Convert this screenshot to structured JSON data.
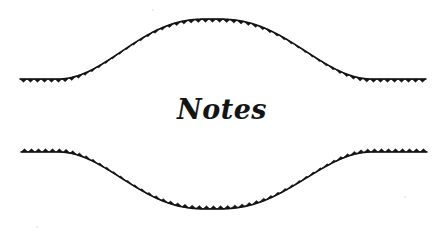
{
  "page": {
    "width": 444,
    "height": 234,
    "background_color": "#ffffff",
    "ink_color": "#141414"
  },
  "heading": {
    "text": "Notes",
    "style": "handwritten-brush-script",
    "center_x": 215,
    "baseline_y": 124
  },
  "ornament": {
    "name": "notes-section-divider",
    "description": "Two mirrored lens-shaped hand-drawn rules with sawtooth serrated edges framing the word Notes",
    "stroke_color": "#141414",
    "stroke_width": 1.6,
    "tooth_height": 3.2,
    "tooth_period": 7.0,
    "curves": [
      {
        "name": "upper-rule",
        "tooth_direction": "down",
        "left_flat": {
          "x_start": 20,
          "x_end": 58,
          "y": 79
        },
        "right_flat": {
          "x_start": 372,
          "x_end": 426,
          "y": 79
        },
        "apex": {
          "x": 212,
          "y": 19
        }
      },
      {
        "name": "lower-rule",
        "tooth_direction": "up",
        "left_flat": {
          "x_start": 21,
          "x_end": 58,
          "y": 152
        },
        "right_flat": {
          "x_start": 372,
          "x_end": 427,
          "y": 152
        },
        "apex": {
          "x": 212,
          "y": 209
        }
      }
    ]
  }
}
